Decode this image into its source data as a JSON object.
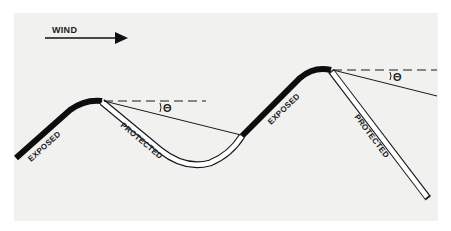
{
  "diagram": {
    "title": "",
    "wind_label": "WIND",
    "theta_symbol": "Θ",
    "ridge1": {
      "exposed_label": "EXPOSED",
      "protected_label": "PROTECTED"
    },
    "ridge2": {
      "exposed_label": "EXPOSED",
      "protected_label": "PROTECTED"
    },
    "colors": {
      "background": "#f1f1ef",
      "line": "#1a1a1a",
      "exposed": "#0d0d0d",
      "protected_fill": "#ffffff"
    }
  }
}
